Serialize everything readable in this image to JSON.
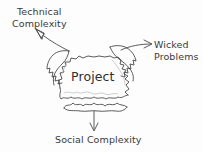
{
  "diagram": {
    "center_node": {
      "label": "Project",
      "shape": "torn-jagged-box"
    },
    "labels": {
      "technical": {
        "line1": "Technical",
        "line2": "Complexity"
      },
      "wicked": {
        "line1": "Wicked",
        "line2": "Problems"
      },
      "social": {
        "line1": "Social Complexity"
      }
    },
    "connectors": [
      {
        "name": "arrow-to-technical-complexity",
        "direction": "up-left",
        "from": "project",
        "to": "technical-complexity"
      },
      {
        "name": "arrow-to-wicked-problems",
        "direction": "up-right",
        "from": "project",
        "to": "wicked-problems"
      },
      {
        "name": "arrow-to-social-complexity",
        "direction": "down",
        "from": "project",
        "to": "social-complexity"
      }
    ],
    "colors": {
      "ink": "#3a3a3a",
      "ink_light": "#6e6e6e",
      "background": "#fdfdfd"
    }
  }
}
